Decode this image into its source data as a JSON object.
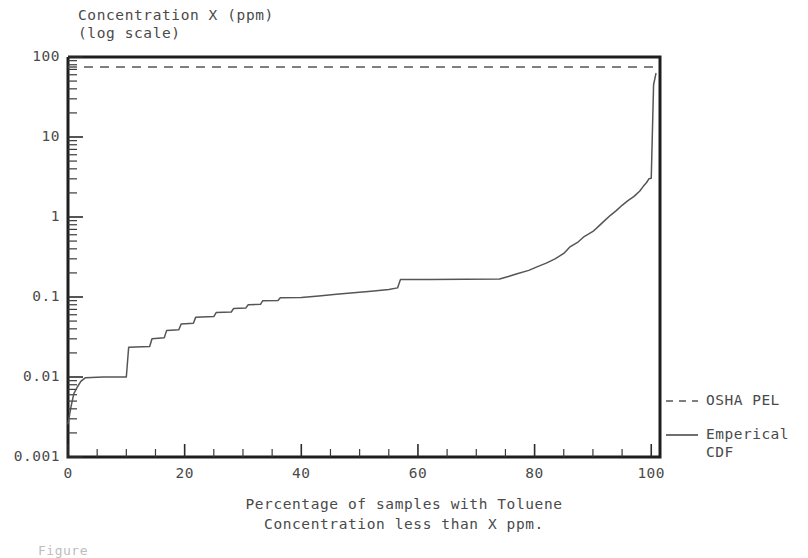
{
  "chart_data": {
    "type": "line",
    "ylabel": "Concentration X (ppm) (log scale)",
    "xlabel": "Percentage of samples with Toluene\nConcentration less than X ppm.",
    "xlabel_line1": "Percentage of samples with Toluene",
    "xlabel_line2": "Concentration less than X ppm.",
    "title_line1": "Concentration X (ppm)",
    "title_line2": "(log scale)",
    "figure_caption": "Figure",
    "yscale": "log",
    "ylim": [
      0.001,
      100
    ],
    "xlim": [
      0,
      101.5
    ],
    "grid": false,
    "legend_position": "right",
    "ytick_labels": [
      "100",
      "10",
      "1",
      "0.1",
      "0.01",
      "0.001"
    ],
    "ytick_values": [
      100,
      10,
      1,
      0.1,
      0.01,
      0.001
    ],
    "xtick_labels": [
      "0",
      "20",
      "40",
      "60",
      "80",
      "100"
    ],
    "xtick_values": [
      0,
      20,
      40,
      60,
      80,
      100
    ],
    "xtick_minor_step": 5,
    "series": [
      {
        "name": "OSHA PEL",
        "style": "dashed",
        "color": "#555555",
        "type": "horizontal-reference",
        "value": 75
      },
      {
        "name": "Emperical CDF",
        "name_line1": "Emperical",
        "name_line2": "CDF",
        "style": "solid",
        "color": "#555555",
        "type": "step-curve",
        "x": [
          0,
          0.5,
          1.0,
          1.6,
          2.2,
          3.0,
          6.0,
          9.5,
          10.0,
          10.4,
          14.0,
          14.4,
          16.5,
          16.9,
          19.0,
          19.4,
          21.5,
          21.9,
          25.0,
          25.4,
          28.0,
          28.4,
          30.5,
          30.9,
          33.0,
          33.4,
          36.0,
          36.4,
          40.0,
          43.0,
          46.0,
          49.0,
          52.0,
          55.0,
          56.5,
          57.0,
          62.0,
          68.0,
          74.0,
          75.5,
          77.0,
          79.0,
          80.5,
          82.0,
          83.5,
          85.0,
          86.0,
          87.5,
          88.5,
          90.0,
          91.0,
          92.0,
          93.0,
          94.0,
          95.0,
          96.0,
          97.0,
          98.0,
          98.6,
          99.2,
          99.6,
          100.0,
          100.4,
          100.8
        ],
        "y": [
          0.0026,
          0.0042,
          0.0062,
          0.0075,
          0.0088,
          0.0098,
          0.01,
          0.01,
          0.01,
          0.0235,
          0.024,
          0.03,
          0.031,
          0.038,
          0.039,
          0.046,
          0.047,
          0.056,
          0.057,
          0.064,
          0.065,
          0.072,
          0.073,
          0.08,
          0.081,
          0.09,
          0.0905,
          0.098,
          0.0985,
          0.103,
          0.108,
          0.113,
          0.118,
          0.124,
          0.13,
          0.165,
          0.166,
          0.167,
          0.168,
          0.18,
          0.195,
          0.215,
          0.24,
          0.265,
          0.3,
          0.35,
          0.42,
          0.49,
          0.57,
          0.66,
          0.77,
          0.9,
          1.05,
          1.2,
          1.4,
          1.6,
          1.8,
          2.1,
          2.4,
          2.7,
          3.0,
          3.05,
          45.0,
          62.0
        ],
        "description": "Empirical cumulative distribution of toluene concentration; rises steeply from 0.003 ppm at 0%, plateaus at 0.01 ppm from 2% to 10%, ascends in discrete steps through 0.1 ppm, plateaus near 0.17 ppm between 57% and 75%, then climbs steeply to about 3 ppm at 99% and spikes to roughly 60 ppm at 100%."
      }
    ],
    "legend": [
      {
        "label": "OSHA PEL",
        "style": "dashed"
      },
      {
        "label": "Emperical CDF",
        "style": "solid"
      }
    ]
  }
}
